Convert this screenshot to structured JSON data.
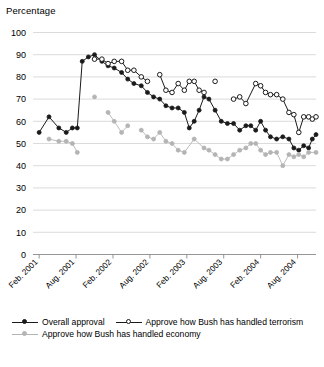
{
  "chart_data": {
    "type": "line",
    "title": "",
    "ylabel": "Percentage",
    "xlabel": "",
    "ylim": [
      0,
      100
    ],
    "ytick_step": 10,
    "yticks": [
      0,
      10,
      20,
      30,
      40,
      50,
      60,
      70,
      80,
      90,
      100
    ],
    "grid": true,
    "legend_position": "bottom-left",
    "x_tick_labels": [
      "Feb. 2001",
      "Aug. 2001",
      "Feb. 2002",
      "Aug. 2002",
      "Feb. 2003",
      "Aug. 2003",
      "Feb. 2004",
      "Aug. 2004"
    ],
    "x_tick_positions_months": [
      0,
      6,
      12,
      18,
      24,
      30,
      36,
      42
    ],
    "x_range_months": [
      -1,
      45
    ],
    "series": [
      {
        "name": "Overall approval",
        "color": "#1a1a1a",
        "marker": "filled-circle",
        "points": [
          {
            "x": 0,
            "y": 55
          },
          {
            "x": 1.6,
            "y": 62
          },
          {
            "x": 3.2,
            "y": 57
          },
          {
            "x": 4.4,
            "y": 55
          },
          {
            "x": 5.4,
            "y": 57
          },
          {
            "x": 6.2,
            "y": 57
          },
          {
            "x": 7.0,
            "y": 87
          },
          {
            "x": 8.0,
            "y": 89
          },
          {
            "x": 9.0,
            "y": 90
          },
          {
            "x": 10.2,
            "y": 87
          },
          {
            "x": 11.2,
            "y": 85
          },
          {
            "x": 12.2,
            "y": 84
          },
          {
            "x": 13.4,
            "y": 82
          },
          {
            "x": 14.4,
            "y": 79
          },
          {
            "x": 15.4,
            "y": 77
          },
          {
            "x": 16.6,
            "y": 76
          },
          {
            "x": 17.6,
            "y": 73
          },
          {
            "x": 18.6,
            "y": 71
          },
          {
            "x": 19.6,
            "y": 70
          },
          {
            "x": 20.6,
            "y": 67
          },
          {
            "x": 21.6,
            "y": 66
          },
          {
            "x": 22.6,
            "y": 66
          },
          {
            "x": 23.6,
            "y": 64
          },
          {
            "x": 24.4,
            "y": 57
          },
          {
            "x": 25.2,
            "y": 60
          },
          {
            "x": 26.0,
            "y": 65
          },
          {
            "x": 26.8,
            "y": 71
          },
          {
            "x": 27.6,
            "y": 70
          },
          {
            "x": 28.6,
            "y": 65
          },
          {
            "x": 29.6,
            "y": 60
          },
          {
            "x": 30.6,
            "y": 59
          },
          {
            "x": 31.6,
            "y": 59
          },
          {
            "x": 32.6,
            "y": 56
          },
          {
            "x": 33.6,
            "y": 58
          },
          {
            "x": 34.4,
            "y": 58
          },
          {
            "x": 35.2,
            "y": 56
          },
          {
            "x": 36.0,
            "y": 60
          },
          {
            "x": 36.8,
            "y": 56
          },
          {
            "x": 37.6,
            "y": 53
          },
          {
            "x": 38.6,
            "y": 52
          },
          {
            "x": 39.6,
            "y": 53
          },
          {
            "x": 40.6,
            "y": 52
          },
          {
            "x": 41.4,
            "y": 48
          },
          {
            "x": 42.2,
            "y": 47
          },
          {
            "x": 43.0,
            "y": 49
          },
          {
            "x": 43.8,
            "y": 48
          },
          {
            "x": 44.4,
            "y": 52
          },
          {
            "x": 45.0,
            "y": 54
          }
        ]
      },
      {
        "name": "Approve how Bush has handled terrorism",
        "color": "#1a1a1a",
        "marker": "open-circle",
        "points": [
          {
            "x": 9.0,
            "y": 88
          },
          {
            "x": 10.2,
            "y": 88
          },
          {
            "x": 11.2,
            "y": 86
          },
          {
            "x": 12.2,
            "y": 87
          },
          {
            "x": 13.4,
            "y": 87
          },
          {
            "x": 14.4,
            "y": 83
          },
          {
            "x": 15.4,
            "y": 83
          },
          {
            "x": 16.6,
            "y": 80
          },
          {
            "x": 17.6,
            "y": 78
          },
          {
            "x": 19.6,
            "y": 81
          },
          {
            "x": 20.6,
            "y": 74
          },
          {
            "x": 21.6,
            "y": 73
          },
          {
            "x": 22.6,
            "y": 77
          },
          {
            "x": 23.6,
            "y": 74
          },
          {
            "x": 24.4,
            "y": 78
          },
          {
            "x": 25.2,
            "y": 78
          },
          {
            "x": 26.0,
            "y": 74
          },
          {
            "x": 26.8,
            "y": 73
          },
          {
            "x": 28.6,
            "y": 78
          },
          {
            "x": 31.6,
            "y": 70
          },
          {
            "x": 32.6,
            "y": 71
          },
          {
            "x": 33.6,
            "y": 68
          },
          {
            "x": 35.2,
            "y": 77
          },
          {
            "x": 36.0,
            "y": 76
          },
          {
            "x": 36.8,
            "y": 73
          },
          {
            "x": 37.6,
            "y": 72
          },
          {
            "x": 38.6,
            "y": 72
          },
          {
            "x": 39.6,
            "y": 70
          },
          {
            "x": 40.6,
            "y": 64
          },
          {
            "x": 41.4,
            "y": 63
          },
          {
            "x": 42.2,
            "y": 55
          },
          {
            "x": 43.0,
            "y": 62
          },
          {
            "x": 43.8,
            "y": 62
          },
          {
            "x": 44.4,
            "y": 61
          },
          {
            "x": 45.0,
            "y": 62
          }
        ]
      },
      {
        "name": "Approve how Bush has handled economy",
        "color": "#b4b4b4",
        "marker": "filled-circle",
        "points": [
          {
            "x": 1.6,
            "y": 52
          },
          {
            "x": 3.2,
            "y": 51
          },
          {
            "x": 4.4,
            "y": 51
          },
          {
            "x": 5.4,
            "y": 50
          },
          {
            "x": 6.2,
            "y": 46
          },
          {
            "x": 9.0,
            "y": 71
          },
          {
            "x": 11.2,
            "y": 64
          },
          {
            "x": 12.2,
            "y": 60
          },
          {
            "x": 13.4,
            "y": 55
          },
          {
            "x": 14.4,
            "y": 58
          },
          {
            "x": 16.6,
            "y": 56
          },
          {
            "x": 17.6,
            "y": 53
          },
          {
            "x": 18.6,
            "y": 52
          },
          {
            "x": 19.6,
            "y": 55
          },
          {
            "x": 20.6,
            "y": 51
          },
          {
            "x": 21.6,
            "y": 50
          },
          {
            "x": 22.6,
            "y": 47
          },
          {
            "x": 23.6,
            "y": 46
          },
          {
            "x": 25.2,
            "y": 52
          },
          {
            "x": 26.8,
            "y": 48
          },
          {
            "x": 27.6,
            "y": 47
          },
          {
            "x": 28.6,
            "y": 45
          },
          {
            "x": 29.6,
            "y": 43
          },
          {
            "x": 30.6,
            "y": 43
          },
          {
            "x": 31.6,
            "y": 45
          },
          {
            "x": 32.6,
            "y": 47
          },
          {
            "x": 33.6,
            "y": 48
          },
          {
            "x": 34.4,
            "y": 50
          },
          {
            "x": 35.2,
            "y": 50
          },
          {
            "x": 36.0,
            "y": 47
          },
          {
            "x": 36.8,
            "y": 45
          },
          {
            "x": 37.6,
            "y": 46
          },
          {
            "x": 38.6,
            "y": 46
          },
          {
            "x": 39.6,
            "y": 40
          },
          {
            "x": 40.6,
            "y": 45
          },
          {
            "x": 41.4,
            "y": 44
          },
          {
            "x": 42.2,
            "y": 45
          },
          {
            "x": 43.0,
            "y": 44
          },
          {
            "x": 43.8,
            "y": 46
          },
          {
            "x": 45.0,
            "y": 46
          }
        ]
      }
    ]
  },
  "legend": {
    "rows": [
      [
        {
          "label": "Overall approval",
          "marker": "filled-circle",
          "color": "#1a1a1a"
        },
        {
          "label": "Approve how Bush has handled terrorism",
          "marker": "open-circle",
          "color": "#1a1a1a"
        }
      ],
      [
        {
          "label": "Approve how Bush has handled economy",
          "marker": "filled-circle",
          "color": "#b4b4b4"
        }
      ]
    ]
  }
}
